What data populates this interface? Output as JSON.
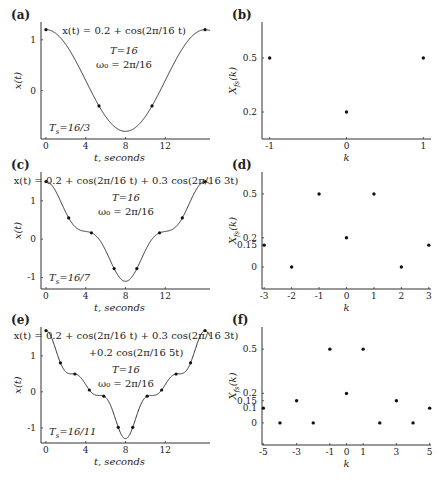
{
  "figure": {
    "panels_left_title": "Continuous-time periodic signals",
    "panels_right_title": "Fourier series coefficients"
  },
  "chart_data": [
    {
      "id": "a",
      "type": "line",
      "panel_label": "(a)",
      "title": "x(t) = 0.2 + cos(2π/16 t)",
      "xlabel": "t, seconds",
      "ylabel": "x(t)",
      "xticks": [
        0,
        4,
        8,
        12
      ],
      "yticks": [
        0,
        1
      ],
      "xlim": [
        -0.5,
        16.5
      ],
      "ylim": [
        -0.95,
        1.35
      ],
      "equation_lines": [
        "x(t) = 0.2 + cos(2π/16 t)"
      ],
      "period_label": "T=16",
      "omega_label": "ω₀ = 2π/16",
      "sampling_label": "Ts=16/3",
      "dc": 0.2,
      "harmonics": [
        {
          "k": 1,
          "amp": 1.0
        }
      ],
      "period": 16,
      "sample_period": 5.3333,
      "sample_points": [
        [
          0,
          1.2
        ],
        [
          5.333,
          -0.3
        ],
        [
          10.667,
          -0.3
        ]
      ]
    },
    {
      "id": "b",
      "type": "scatter",
      "panel_label": "(b)",
      "xlabel": "k",
      "ylabel": "X_fs(k)",
      "xticks": [
        -1,
        0,
        1
      ],
      "yticks": [
        0.2,
        0.5
      ],
      "xlim": [
        -1.1,
        1.1
      ],
      "ylim": [
        0.05,
        0.7
      ],
      "points": [
        [
          -1,
          0.5
        ],
        [
          0,
          0.2
        ],
        [
          1,
          0.5
        ]
      ]
    },
    {
      "id": "c",
      "type": "line",
      "panel_label": "(c)",
      "xlabel": "t, seconds",
      "ylabel": "x(t)",
      "xticks": [
        0,
        4,
        8,
        12
      ],
      "yticks": [
        -1,
        0,
        1
      ],
      "xlim": [
        -0.5,
        16.5
      ],
      "ylim": [
        -1.3,
        1.75
      ],
      "equation_lines": [
        "x(t) = 0.2 + cos(2π/16 t) + 0.3 cos(2π/16 3t)"
      ],
      "period_label": "T=16",
      "omega_label": "ω₀ = 2π/16",
      "sampling_label": "Ts=16/7",
      "dc": 0.2,
      "harmonics": [
        {
          "k": 1,
          "amp": 1.0
        },
        {
          "k": 3,
          "amp": 0.3
        }
      ],
      "period": 16,
      "sample_period": 2.2857
    },
    {
      "id": "d",
      "type": "scatter",
      "panel_label": "(d)",
      "xlabel": "k",
      "ylabel": "X_fs(k)",
      "xticks": [
        -3,
        -2,
        -1,
        0,
        1,
        2,
        3
      ],
      "yticks": [
        0,
        0.15,
        0.2,
        0.5
      ],
      "xlim": [
        -3.08,
        3.08
      ],
      "ylim": [
        -0.15,
        0.65
      ],
      "points": [
        [
          -3,
          0.15
        ],
        [
          -2,
          0
        ],
        [
          -1,
          0.5
        ],
        [
          0,
          0.2
        ],
        [
          1,
          0.5
        ],
        [
          2,
          0
        ],
        [
          3,
          0.15
        ]
      ]
    },
    {
      "id": "e",
      "type": "line",
      "panel_label": "(e)",
      "xlabel": "t, seconds",
      "ylabel": "x(t)",
      "xticks": [
        0,
        4,
        8,
        12
      ],
      "yticks": [
        -1,
        0,
        1
      ],
      "xlim": [
        -0.5,
        16.5
      ],
      "ylim": [
        -1.42,
        1.8
      ],
      "equation_lines": [
        "x(t) = 0.2 + cos(2π/16 t) + 0.3 cos(2π/16 3t)",
        "+0.2 cos(2π/16 5t)"
      ],
      "period_label": "T=16",
      "omega_label": "ω₀ = 2π/16",
      "sampling_label": "Ts=16/11",
      "dc": 0.2,
      "harmonics": [
        {
          "k": 1,
          "amp": 1.0
        },
        {
          "k": 3,
          "amp": 0.3
        },
        {
          "k": 5,
          "amp": 0.2
        }
      ],
      "period": 16,
      "sample_period": 1.4545
    },
    {
      "id": "f",
      "type": "scatter",
      "panel_label": "(f)",
      "xlabel": "k",
      "ylabel": "X_fs(k)",
      "xticks": [
        -5,
        -3,
        -1,
        0,
        1,
        3,
        5
      ],
      "yticks": [
        0,
        0.1,
        0.15,
        0.2,
        0.5
      ],
      "xlim": [
        -5.08,
        5.08
      ],
      "ylim": [
        -0.15,
        0.65
      ],
      "points": [
        [
          -5,
          0.1
        ],
        [
          -4,
          0
        ],
        [
          -3,
          0.15
        ],
        [
          -2,
          0
        ],
        [
          -1,
          0.5
        ],
        [
          0,
          0.2
        ],
        [
          1,
          0.5
        ],
        [
          2,
          0
        ],
        [
          3,
          0.15
        ],
        [
          4,
          0
        ],
        [
          5,
          0.1
        ]
      ]
    }
  ],
  "layout": {
    "panels": {
      "a": {
        "x0": 41,
        "x1": 210,
        "y0": 22,
        "y1": 139
      },
      "b": {
        "x0": 262,
        "x1": 431,
        "y0": 22,
        "y1": 139
      },
      "c": {
        "x0": 41,
        "x1": 210,
        "y0": 172,
        "y1": 289
      },
      "d": {
        "x0": 262,
        "x1": 431,
        "y0": 172,
        "y1": 289
      },
      "e": {
        "x0": 41,
        "x1": 210,
        "y0": 327,
        "y1": 443
      },
      "f": {
        "x0": 262,
        "x1": 431,
        "y0": 327,
        "y1": 445
      }
    }
  }
}
